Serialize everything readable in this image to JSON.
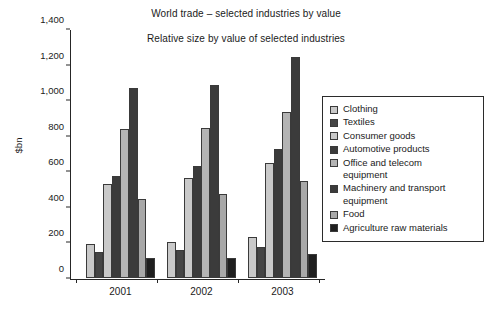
{
  "chart_data": {
    "type": "bar",
    "title": "World trade – selected industries by value",
    "subtitle": "Relative size by value of selected industries",
    "xlabel": "",
    "ylabel": "$bn",
    "ylim": [
      0,
      1400
    ],
    "ytick_values": [
      0,
      200,
      400,
      600,
      800,
      1000,
      1200,
      1400
    ],
    "ytick_labels": [
      "0",
      "200",
      "400",
      "600",
      "800",
      "1,000",
      "1,200",
      "1,400"
    ],
    "grid": false,
    "legend_position": "right",
    "categories": [
      "2001",
      "2002",
      "2003"
    ],
    "series": [
      {
        "name": "Clothing",
        "color": "#c9c9c9",
        "values": [
          193,
          202,
          228
        ]
      },
      {
        "name": "Textiles",
        "color": "#454545",
        "values": [
          145,
          155,
          172
        ]
      },
      {
        "name": "Consumer goods",
        "color": "#c9c9c9",
        "values": [
          530,
          560,
          645
        ]
      },
      {
        "name": "Automotive products",
        "color": "#3b3b3b",
        "values": [
          573,
          630,
          727
        ]
      },
      {
        "name": "Office and telecom\nequipment",
        "color": "#b4b4b4",
        "values": [
          838,
          845,
          935
        ]
      },
      {
        "name": "Machinery and transport\nequipment",
        "color": "#3b3b3b",
        "values": [
          1068,
          1085,
          1240
        ]
      },
      {
        "name": "Food",
        "color": "#a8a8a8",
        "values": [
          443,
          475,
          548
        ]
      },
      {
        "name": "Agriculture raw materials",
        "color": "#1f1f1f",
        "values": [
          110,
          115,
          135
        ]
      }
    ]
  }
}
